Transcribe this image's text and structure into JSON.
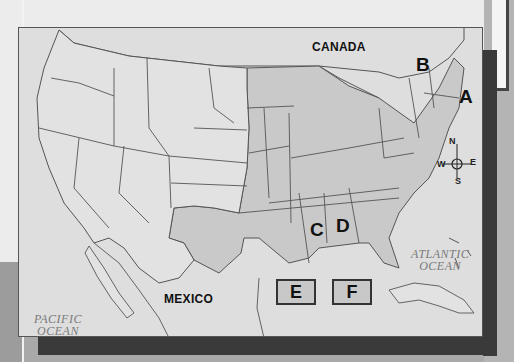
{
  "map": {
    "title": "",
    "countries": {
      "north": "CANADA",
      "south": "MEXICO"
    },
    "oceans": {
      "west": [
        "PACIFIC",
        "OCEAN"
      ],
      "east": [
        "ATLANTIC",
        "OCEAN"
      ]
    },
    "markers": [
      {
        "id": "A",
        "label": "A"
      },
      {
        "id": "B",
        "label": "B"
      },
      {
        "id": "C",
        "label": "C"
      },
      {
        "id": "D",
        "label": "D"
      }
    ],
    "answer_boxes": [
      {
        "id": "E",
        "label": "E"
      },
      {
        "id": "F",
        "label": "F"
      }
    ],
    "compass": {
      "n": "N",
      "s": "S",
      "e": "E",
      "w": "W"
    },
    "colors": {
      "shaded_states": "#c9c9c9",
      "unshaded_land": "#e2e2e2",
      "water": "#dedede",
      "border": "#555555",
      "frame_shadow": "#3a3a3a"
    }
  }
}
